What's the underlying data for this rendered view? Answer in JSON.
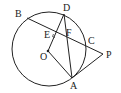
{
  "diagram": {
    "type": "geometry",
    "circle": {
      "center": "O",
      "cx": 49,
      "cy": 49,
      "r": 37
    },
    "points": {
      "B": {
        "x": 27,
        "y": 18,
        "label": "B",
        "lx": 15,
        "ly": 17
      },
      "D": {
        "x": 64,
        "y": 14,
        "label": "D",
        "lx": 63,
        "ly": 11
      },
      "E": {
        "x": 56,
        "y": 35,
        "label": "E",
        "lx": 44,
        "ly": 38
      },
      "F": {
        "x": 64,
        "y": 39,
        "label": "F",
        "lx": 66,
        "ly": 36
      },
      "C": {
        "x": 86,
        "y": 44,
        "label": "C",
        "lx": 88,
        "ly": 44
      },
      "P": {
        "x": 103,
        "y": 54,
        "label": "P",
        "lx": 106,
        "ly": 58
      },
      "O": {
        "x": 48,
        "y": 51,
        "label": "O",
        "lx": 40,
        "ly": 60
      },
      "A": {
        "x": 72,
        "y": 78,
        "label": "A",
        "lx": 70,
        "ly": 89
      }
    },
    "segments": [
      [
        "B",
        "P"
      ],
      [
        "O",
        "D"
      ],
      [
        "D",
        "A"
      ],
      [
        "O",
        "A"
      ],
      [
        "A",
        "P"
      ]
    ],
    "right_angle_mark": "E",
    "labels": [
      "B",
      "D",
      "E",
      "F",
      "C",
      "P",
      "O",
      "A"
    ]
  }
}
